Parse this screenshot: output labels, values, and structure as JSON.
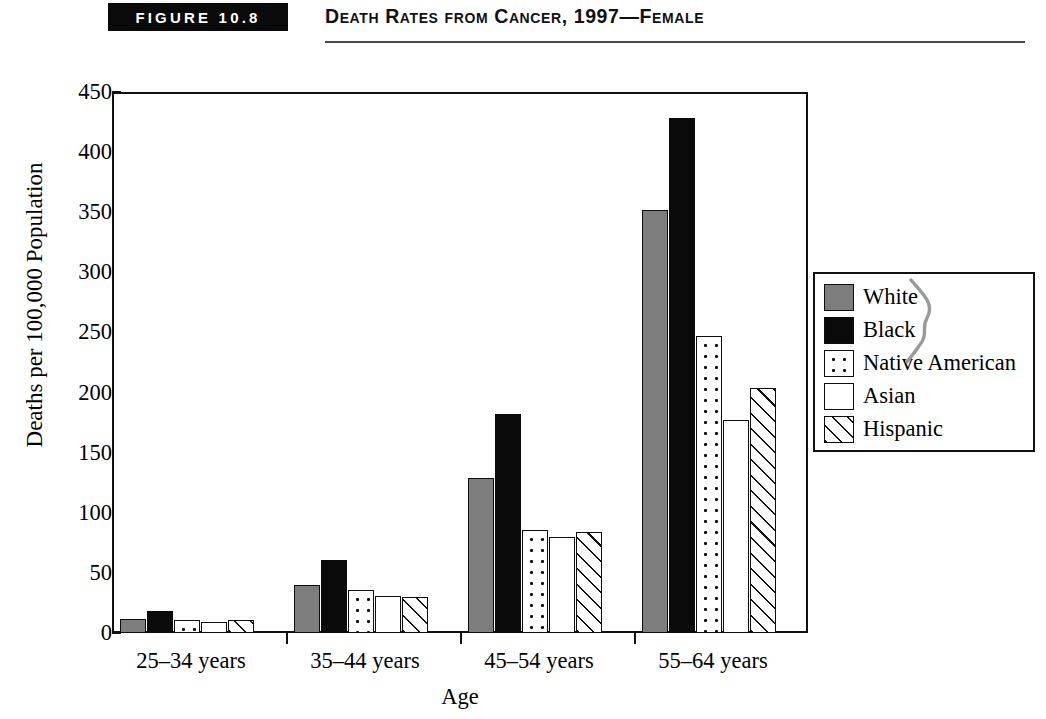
{
  "header": {
    "figure_badge": "FIGURE 10.8",
    "title": "Death Rates from Cancer, 1997—Female"
  },
  "chart_data": {
    "type": "bar",
    "title": "Death Rates from Cancer, 1997—Female",
    "xlabel": "Age",
    "ylabel": "Deaths per 100,000 Population",
    "categories": [
      "25–34 years",
      "35–44 years",
      "45–54 years",
      "55–64 years"
    ],
    "series": [
      {
        "name": "White",
        "pattern": "solid-gray",
        "color": "#7d7d7d",
        "values": [
          12,
          40,
          129,
          352
        ]
      },
      {
        "name": "Black",
        "pattern": "solid-black",
        "color": "#0a0a0a",
        "values": [
          18,
          61,
          182,
          428
        ]
      },
      {
        "name": "Native American",
        "pattern": "dotted",
        "color": "#ffffff",
        "values": [
          11,
          36,
          86,
          247
        ]
      },
      {
        "name": "Asian",
        "pattern": "empty",
        "color": "#ffffff",
        "values": [
          9,
          31,
          80,
          177
        ]
      },
      {
        "name": "Hispanic",
        "pattern": "diagonal-hatch",
        "color": "#ffffff",
        "values": [
          11,
          30,
          84,
          204
        ]
      }
    ],
    "ylim": [
      0,
      450
    ],
    "yticks": [
      0,
      50,
      100,
      150,
      200,
      250,
      300,
      350,
      400,
      450
    ],
    "ytick_labels": [
      "0",
      "50",
      "100",
      "150",
      "200",
      "250",
      "300",
      "350",
      "400",
      "450"
    ],
    "grid": false,
    "legend_position": "right"
  },
  "footnote": ""
}
